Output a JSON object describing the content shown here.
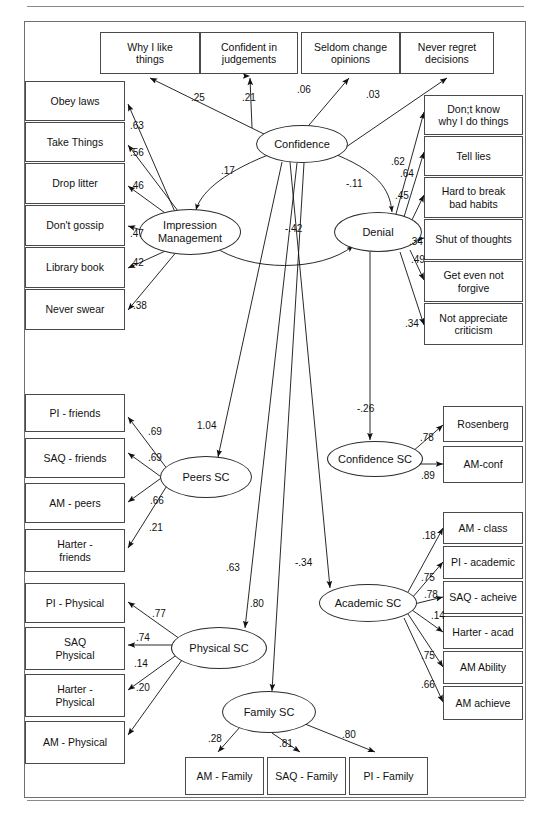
{
  "diagram": {
    "type": "sem-path-diagram",
    "frame_border_color": "#6f6f6f",
    "box_border_color": "#4a4a4a",
    "ellipse_border_color": "#2b2b2b",
    "caption": ""
  },
  "observed": {
    "confidence_indicators": [
      {
        "id": "why-i-like-things",
        "label": "Why I like\nthings",
        "x": 100,
        "y": 32,
        "w": 100,
        "h": 42
      },
      {
        "id": "confident-in-judgements",
        "label": "Confident in\njudgements",
        "x": 200,
        "y": 32,
        "w": 98,
        "h": 42
      },
      {
        "id": "seldom-change-opinions",
        "label": "Seldom change\nopinions",
        "x": 301,
        "y": 32,
        "w": 99,
        "h": 42
      },
      {
        "id": "never-regret-decisions",
        "label": "Never regret\ndecisions",
        "x": 400,
        "y": 32,
        "w": 94,
        "h": 42
      }
    ],
    "impression_management_indicators": [
      {
        "id": "obey-laws",
        "label": "Obey laws",
        "x": 25,
        "y": 81,
        "w": 100,
        "h": 40
      },
      {
        "id": "take-things",
        "label": "Take Things",
        "x": 25,
        "y": 122,
        "w": 100,
        "h": 40
      },
      {
        "id": "drop-litter",
        "label": "Drop litter",
        "x": 25,
        "y": 163,
        "w": 100,
        "h": 41
      },
      {
        "id": "dont-gossip",
        "label": "Don't gossip",
        "x": 25,
        "y": 205,
        "w": 100,
        "h": 41
      },
      {
        "id": "library-book",
        "label": "Library book",
        "x": 25,
        "y": 247,
        "w": 100,
        "h": 41
      },
      {
        "id": "never-swear",
        "label": "Never swear",
        "x": 25,
        "y": 289,
        "w": 100,
        "h": 41
      }
    ],
    "denial_indicators": [
      {
        "id": "dont-know-why-i-do-things",
        "label": "Don;t know\nwhy I do things",
        "x": 424,
        "y": 95,
        "w": 99,
        "h": 40
      },
      {
        "id": "tell-lies",
        "label": "Tell lies",
        "x": 424,
        "y": 136,
        "w": 99,
        "h": 40
      },
      {
        "id": "hard-to-break-bad-habits",
        "label": "Hard to break\nbad habits",
        "x": 424,
        "y": 177,
        "w": 99,
        "h": 41
      },
      {
        "id": "shut-of-thoughts",
        "label": "Shut of thoughts",
        "x": 424,
        "y": 219,
        "w": 99,
        "h": 41
      },
      {
        "id": "get-even-not-forgive",
        "label": "Get even not\nforgive",
        "x": 424,
        "y": 261,
        "w": 99,
        "h": 41
      },
      {
        "id": "not-appreciate-criticism",
        "label": "Not appreciate\ncriticism",
        "x": 424,
        "y": 303,
        "w": 99,
        "h": 42
      }
    ],
    "peers_indicators": [
      {
        "id": "pi-friends",
        "label": "PI - friends",
        "x": 25,
        "y": 394,
        "w": 100,
        "h": 38
      },
      {
        "id": "saq-friends",
        "label": "SAQ - friends",
        "x": 25,
        "y": 438,
        "w": 100,
        "h": 40
      },
      {
        "id": "am-peers",
        "label": "AM - peers",
        "x": 25,
        "y": 483,
        "w": 100,
        "h": 40
      },
      {
        "id": "harter-friends",
        "label": "Harter -\nfriends",
        "x": 25,
        "y": 529,
        "w": 100,
        "h": 43
      }
    ],
    "physical_indicators": [
      {
        "id": "pi-physical",
        "label": "PI  - Physical",
        "x": 25,
        "y": 583,
        "w": 100,
        "h": 40
      },
      {
        "id": "saq-physical",
        "label": "SAQ\nPhysical",
        "x": 25,
        "y": 627,
        "w": 100,
        "h": 43
      },
      {
        "id": "harter-physical",
        "label": "Harter -\nPhysical",
        "x": 25,
        "y": 674,
        "w": 100,
        "h": 43
      },
      {
        "id": "am-physical",
        "label": "AM - Physical",
        "x": 25,
        "y": 721,
        "w": 100,
        "h": 43
      }
    ],
    "confidence_sc_indicators": [
      {
        "id": "rosenberg",
        "label": "Rosenberg",
        "x": 443,
        "y": 406,
        "w": 80,
        "h": 36
      },
      {
        "id": "am-conf",
        "label": "AM-conf",
        "x": 443,
        "y": 446,
        "w": 80,
        "h": 37
      }
    ],
    "academic_indicators": [
      {
        "id": "am-class",
        "label": "AM - class",
        "x": 443,
        "y": 512,
        "w": 80,
        "h": 32
      },
      {
        "id": "pi-academic",
        "label": "PI - academic",
        "x": 443,
        "y": 546,
        "w": 80,
        "h": 33
      },
      {
        "id": "saq-acheive",
        "label": "SAQ - acheive",
        "x": 443,
        "y": 581,
        "w": 80,
        "h": 33
      },
      {
        "id": "harter-acad",
        "label": "Harter - acad",
        "x": 443,
        "y": 616,
        "w": 80,
        "h": 33
      },
      {
        "id": "am-ability",
        "label": "AM Ability",
        "x": 443,
        "y": 651,
        "w": 80,
        "h": 33
      },
      {
        "id": "am-achieve",
        "label": "AM achieve",
        "x": 443,
        "y": 686,
        "w": 80,
        "h": 34
      }
    ],
    "family_indicators": [
      {
        "id": "am-family",
        "label": "AM - Family",
        "x": 185,
        "y": 757,
        "w": 79,
        "h": 38
      },
      {
        "id": "saq-family",
        "label": "SAQ - Family",
        "x": 267,
        "y": 757,
        "w": 79,
        "h": 38
      },
      {
        "id": "pi-family",
        "label": "PI - Family",
        "x": 349,
        "y": 757,
        "w": 79,
        "h": 38
      }
    ]
  },
  "latent": [
    {
      "id": "confidence",
      "label": "Confidence",
      "cx": 302,
      "cy": 144,
      "rx": 46,
      "ry": 19
    },
    {
      "id": "impression-management",
      "label": "Impression\nManagement",
      "cx": 190,
      "cy": 232,
      "rx": 51,
      "ry": 23
    },
    {
      "id": "denial",
      "label": "Denial",
      "cx": 378,
      "cy": 232,
      "rx": 44,
      "ry": 20
    },
    {
      "id": "peers-sc",
      "label": "Peers SC",
      "cx": 206,
      "cy": 477,
      "rx": 46,
      "ry": 21
    },
    {
      "id": "confidence-sc",
      "label": "Confidence SC",
      "cx": 375,
      "cy": 459,
      "rx": 48,
      "ry": 18
    },
    {
      "id": "physical-sc",
      "label": "Physical SC",
      "cx": 219,
      "cy": 648,
      "rx": 48,
      "ry": 21
    },
    {
      "id": "academic-sc",
      "label": "Academic SC",
      "cx": 368,
      "cy": 603,
      "rx": 49,
      "ry": 19
    },
    {
      "id": "family-sc",
      "label": "Family SC",
      "cx": 269,
      "cy": 712,
      "rx": 47,
      "ry": 21
    }
  ],
  "coefficients": [
    {
      "id": "conf-to-why-i-like-things",
      "value": ".25",
      "x": 191,
      "y": 92
    },
    {
      "id": "conf-to-confident-in-judgements",
      "value": ".21",
      "x": 242,
      "y": 92
    },
    {
      "id": "conf-to-seldom-change-opinions",
      "value": ".06",
      "x": 297,
      "y": 84
    },
    {
      "id": "conf-to-never-regret-decisions",
      "value": ".03",
      "x": 366,
      "y": 89
    },
    {
      "id": "im-to-obey-laws",
      "value": ".63",
      "x": 130,
      "y": 120
    },
    {
      "id": "im-to-take-things",
      "value": ".56",
      "x": 130,
      "y": 147
    },
    {
      "id": "im-to-drop-litter",
      "value": ".46",
      "x": 130,
      "y": 180
    },
    {
      "id": "im-to-dont-gossip",
      "value": ".47",
      "x": 130,
      "y": 228
    },
    {
      "id": "im-to-library-book",
      "value": ".42",
      "x": 130,
      "y": 257
    },
    {
      "id": "im-to-never-swear",
      "value": ".38",
      "x": 133,
      "y": 300
    },
    {
      "id": "denial-to-dont-know",
      "value": ".62",
      "x": 391,
      "y": 156
    },
    {
      "id": "denial-to-tell-lies",
      "value": ".64",
      "x": 400,
      "y": 168
    },
    {
      "id": "denial-to-hard-to-break",
      "value": ".45",
      "x": 395,
      "y": 190
    },
    {
      "id": "denial-to-shut-of-thoughts",
      "value": ".34",
      "x": 409,
      "y": 236
    },
    {
      "id": "denial-to-get-even",
      "value": ".49",
      "x": 411,
      "y": 254
    },
    {
      "id": "denial-to-not-appreciate",
      "value": ".34",
      "x": 405,
      "y": 318
    },
    {
      "id": "conf-with-im",
      "value": ".17",
      "x": 221,
      "y": 165
    },
    {
      "id": "conf-with-denial",
      "value": "-.11",
      "x": 346,
      "y": 178
    },
    {
      "id": "im-with-denial",
      "value": "-.42",
      "x": 285,
      "y": 223
    },
    {
      "id": "conf-to-peers-sc",
      "value": "1.04",
      "x": 197,
      "y": 420
    },
    {
      "id": "denial-to-confidence-sc",
      "value": "-.26",
      "x": 357,
      "y": 403
    },
    {
      "id": "conf-to-academic-sc",
      "value": "-.34",
      "x": 295,
      "y": 557
    },
    {
      "id": "conf-to-physical-sc",
      "value": ".63",
      "x": 226,
      "y": 562
    },
    {
      "id": "conf-to-family-sc",
      "value": ".80",
      "x": 250,
      "y": 598
    },
    {
      "id": "peers-to-pi-friends",
      "value": ".69",
      "x": 148,
      "y": 426
    },
    {
      "id": "peers-to-saq-friends",
      "value": ".69",
      "x": 148,
      "y": 452
    },
    {
      "id": "peers-to-am-peers",
      "value": ".66",
      "x": 150,
      "y": 495
    },
    {
      "id": "peers-to-harter-friends",
      "value": ".21",
      "x": 149,
      "y": 522
    },
    {
      "id": "confsc-to-rosenberg",
      "value": ".78",
      "x": 420,
      "y": 432
    },
    {
      "id": "confsc-to-am-conf",
      "value": ".89",
      "x": 421,
      "y": 470
    },
    {
      "id": "acad-to-am-class",
      "value": ".18",
      "x": 422,
      "y": 530
    },
    {
      "id": "acad-to-pi-academic",
      "value": ".75",
      "x": 421,
      "y": 572
    },
    {
      "id": "acad-to-saq-acheive",
      "value": ".78",
      "x": 424,
      "y": 589
    },
    {
      "id": "acad-to-harter-acad",
      "value": ".14",
      "x": 431,
      "y": 610
    },
    {
      "id": "acad-to-am-ability",
      "value": ".75",
      "x": 421,
      "y": 650
    },
    {
      "id": "acad-to-am-achieve",
      "value": ".66",
      "x": 421,
      "y": 679
    },
    {
      "id": "phys-to-pi-physical",
      "value": ".77",
      "x": 152,
      "y": 608
    },
    {
      "id": "phys-to-saq-physical",
      "value": ".74",
      "x": 136,
      "y": 632
    },
    {
      "id": "phys-to-harter-physical",
      "value": ".14",
      "x": 134,
      "y": 658
    },
    {
      "id": "phys-to-am-physical",
      "value": ".20",
      "x": 136,
      "y": 682
    },
    {
      "id": "family-to-am-family",
      "value": ".28",
      "x": 208,
      "y": 733
    },
    {
      "id": "family-to-saq-family",
      "value": ".81",
      "x": 279,
      "y": 738
    },
    {
      "id": "family-to-pi-family",
      "value": ".80",
      "x": 342,
      "y": 729
    }
  ],
  "edges": [
    {
      "id": "conf-why-i-like-things",
      "d": "M 268 136 L 150 78",
      "arrow": "end"
    },
    {
      "id": "conf-confident-in-judgements",
      "d": "M 250 76 L 250 76",
      "arrow": "end"
    },
    {
      "id": "conf-seldom-change",
      "d": "M 281 158 L 349 78",
      "arrow": "end"
    },
    {
      "id": "conf-never-regret",
      "d": "M 330 158 L 447 78",
      "arrow": "end"
    },
    {
      "id": "conf-judgements-vert",
      "d": "M 252 128 L 250 78",
      "arrow": "end"
    },
    {
      "id": "im-obey-laws",
      "d": "M 175 212 L 128 104",
      "arrow": "end"
    },
    {
      "id": "im-take-things",
      "d": "M 178 211 L 128 145",
      "arrow": "end"
    },
    {
      "id": "im-drop-litter",
      "d": "M 172 218 L 128 186",
      "arrow": "end"
    },
    {
      "id": "im-dont-gossip",
      "d": "M 148 232 L 128 226",
      "arrow": "end"
    },
    {
      "id": "im-library-book",
      "d": "M 172 248 L 128 268",
      "arrow": "end"
    },
    {
      "id": "im-never-swear",
      "d": "M 178 250 L 128 310",
      "arrow": "end"
    },
    {
      "id": "den-dont-know",
      "d": "M 396 214 L 424 112",
      "arrow": "end"
    },
    {
      "id": "den-tell-lies",
      "d": "M 404 217 L 424 152",
      "arrow": "end"
    },
    {
      "id": "den-hard-break",
      "d": "M 410 224 L 424 195",
      "arrow": "end"
    },
    {
      "id": "den-shut-thoughts",
      "d": "M 414 240 L 424 238",
      "arrow": "end"
    },
    {
      "id": "den-get-even",
      "d": "M 410 250 L 424 280",
      "arrow": "end"
    },
    {
      "id": "den-not-appreciate",
      "d": "M 400 252 L 424 325",
      "arrow": "end"
    },
    {
      "id": "conf-peers-sc",
      "d": "M 282 162 L 218 457",
      "arrow": "end"
    },
    {
      "id": "den-confidence-sc",
      "d": "M 370 252 L 370 440",
      "arrow": "end"
    },
    {
      "id": "conf-academic-sc",
      "d": "M 290 162 L 330 588",
      "arrow": "end"
    },
    {
      "id": "conf-physical-sc",
      "d": "M 297 163 L 245 628",
      "arrow": "end"
    },
    {
      "id": "conf-family-sc",
      "d": "M 304 163 L 272 691",
      "arrow": "end"
    },
    {
      "id": "peers-pi-friends",
      "d": "M 168 470 L 128 417",
      "arrow": "end"
    },
    {
      "id": "peers-saq-friends",
      "d": "M 164 479 L 128 453",
      "arrow": "end"
    },
    {
      "id": "peers-am-peers",
      "d": "M 164 476 L 128 502",
      "arrow": "end"
    },
    {
      "id": "peers-harter-friends",
      "d": "M 168 484 L 128 548",
      "arrow": "end"
    },
    {
      "id": "confsc-rosenberg",
      "d": "M 412 452 L 443 425",
      "arrow": "end"
    },
    {
      "id": "confsc-am-conf",
      "d": "M 414 464 L 443 464",
      "arrow": "end"
    },
    {
      "id": "acad-am-class",
      "d": "M 408 592 L 443 528",
      "arrow": "end"
    },
    {
      "id": "acad-pi-academic",
      "d": "M 412 598 L 443 562",
      "arrow": "end"
    },
    {
      "id": "acad-saq-acheive",
      "d": "M 414 604 L 443 597",
      "arrow": "end"
    },
    {
      "id": "acad-harter-acad",
      "d": "M 412 610 L 443 632",
      "arrow": "end"
    },
    {
      "id": "acad-am-ability",
      "d": "M 408 614 L 443 667",
      "arrow": "end"
    },
    {
      "id": "acad-am-achieve",
      "d": "M 404 618 L 443 702",
      "arrow": "end"
    },
    {
      "id": "phys-pi-physical",
      "d": "M 180 639 L 128 602",
      "arrow": "end"
    },
    {
      "id": "phys-saq-physical",
      "d": "M 176 645 L 128 645",
      "arrow": "end"
    },
    {
      "id": "phys-harter-physical",
      "d": "M 178 654 L 128 690",
      "arrow": "end"
    },
    {
      "id": "phys-am-physical",
      "d": "M 182 660 L 128 735",
      "arrow": "end"
    },
    {
      "id": "family-am-family",
      "d": "M 240 727 L 218 752",
      "arrow": "end"
    },
    {
      "id": "family-saq-family",
      "d": "M 272 733 L 300 752",
      "arrow": "end"
    },
    {
      "id": "family-pi-family",
      "d": "M 300 722 L 375 752",
      "arrow": "end"
    }
  ],
  "covariances": [
    {
      "id": "cov-confidence-impression",
      "d": "M 268 155 C 218 175 200 195 196 210",
      "arrows": "both"
    },
    {
      "id": "cov-confidence-denial",
      "d": "M 337 155 C 385 175 390 195 392 212",
      "arrows": "both"
    },
    {
      "id": "cov-impression-denial",
      "d": "M 213 246 C 250 272 320 272 353 246",
      "arrows": "both"
    }
  ]
}
